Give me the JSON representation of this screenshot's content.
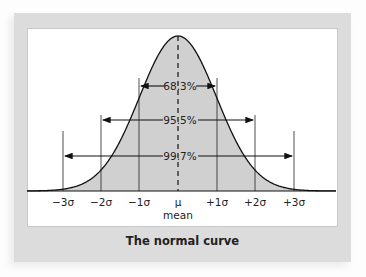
{
  "title": "The normal curve",
  "chart_data": {
    "type": "area",
    "title": "The normal curve",
    "xlabel": "",
    "ylabel": "",
    "x_ticks": [
      "−3σ",
      "−2σ",
      "−1σ",
      "μ",
      "+1σ",
      "+2σ",
      "+3σ"
    ],
    "x_tick_values": [
      -3,
      -2,
      -1,
      0,
      1,
      2,
      3
    ],
    "mean_label": "mean",
    "intervals": [
      {
        "label": "68.3%",
        "from": -1,
        "to": 1,
        "value": 68.3
      },
      {
        "label": "95.5%",
        "from": -2,
        "to": 2,
        "value": 95.5
      },
      {
        "label": "99.7%",
        "from": -3,
        "to": 3,
        "value": 99.7
      }
    ],
    "fill_color": "#d0d0d0",
    "grid": false
  },
  "labels": {
    "p1": "68.3%",
    "p2": "95.5%",
    "p3": "99.7%",
    "t0": "−3σ",
    "t1": "−2σ",
    "t2": "−1σ",
    "t3": "μ",
    "t4": "+1σ",
    "t5": "+2σ",
    "t6": "+3σ",
    "mean": "mean"
  }
}
